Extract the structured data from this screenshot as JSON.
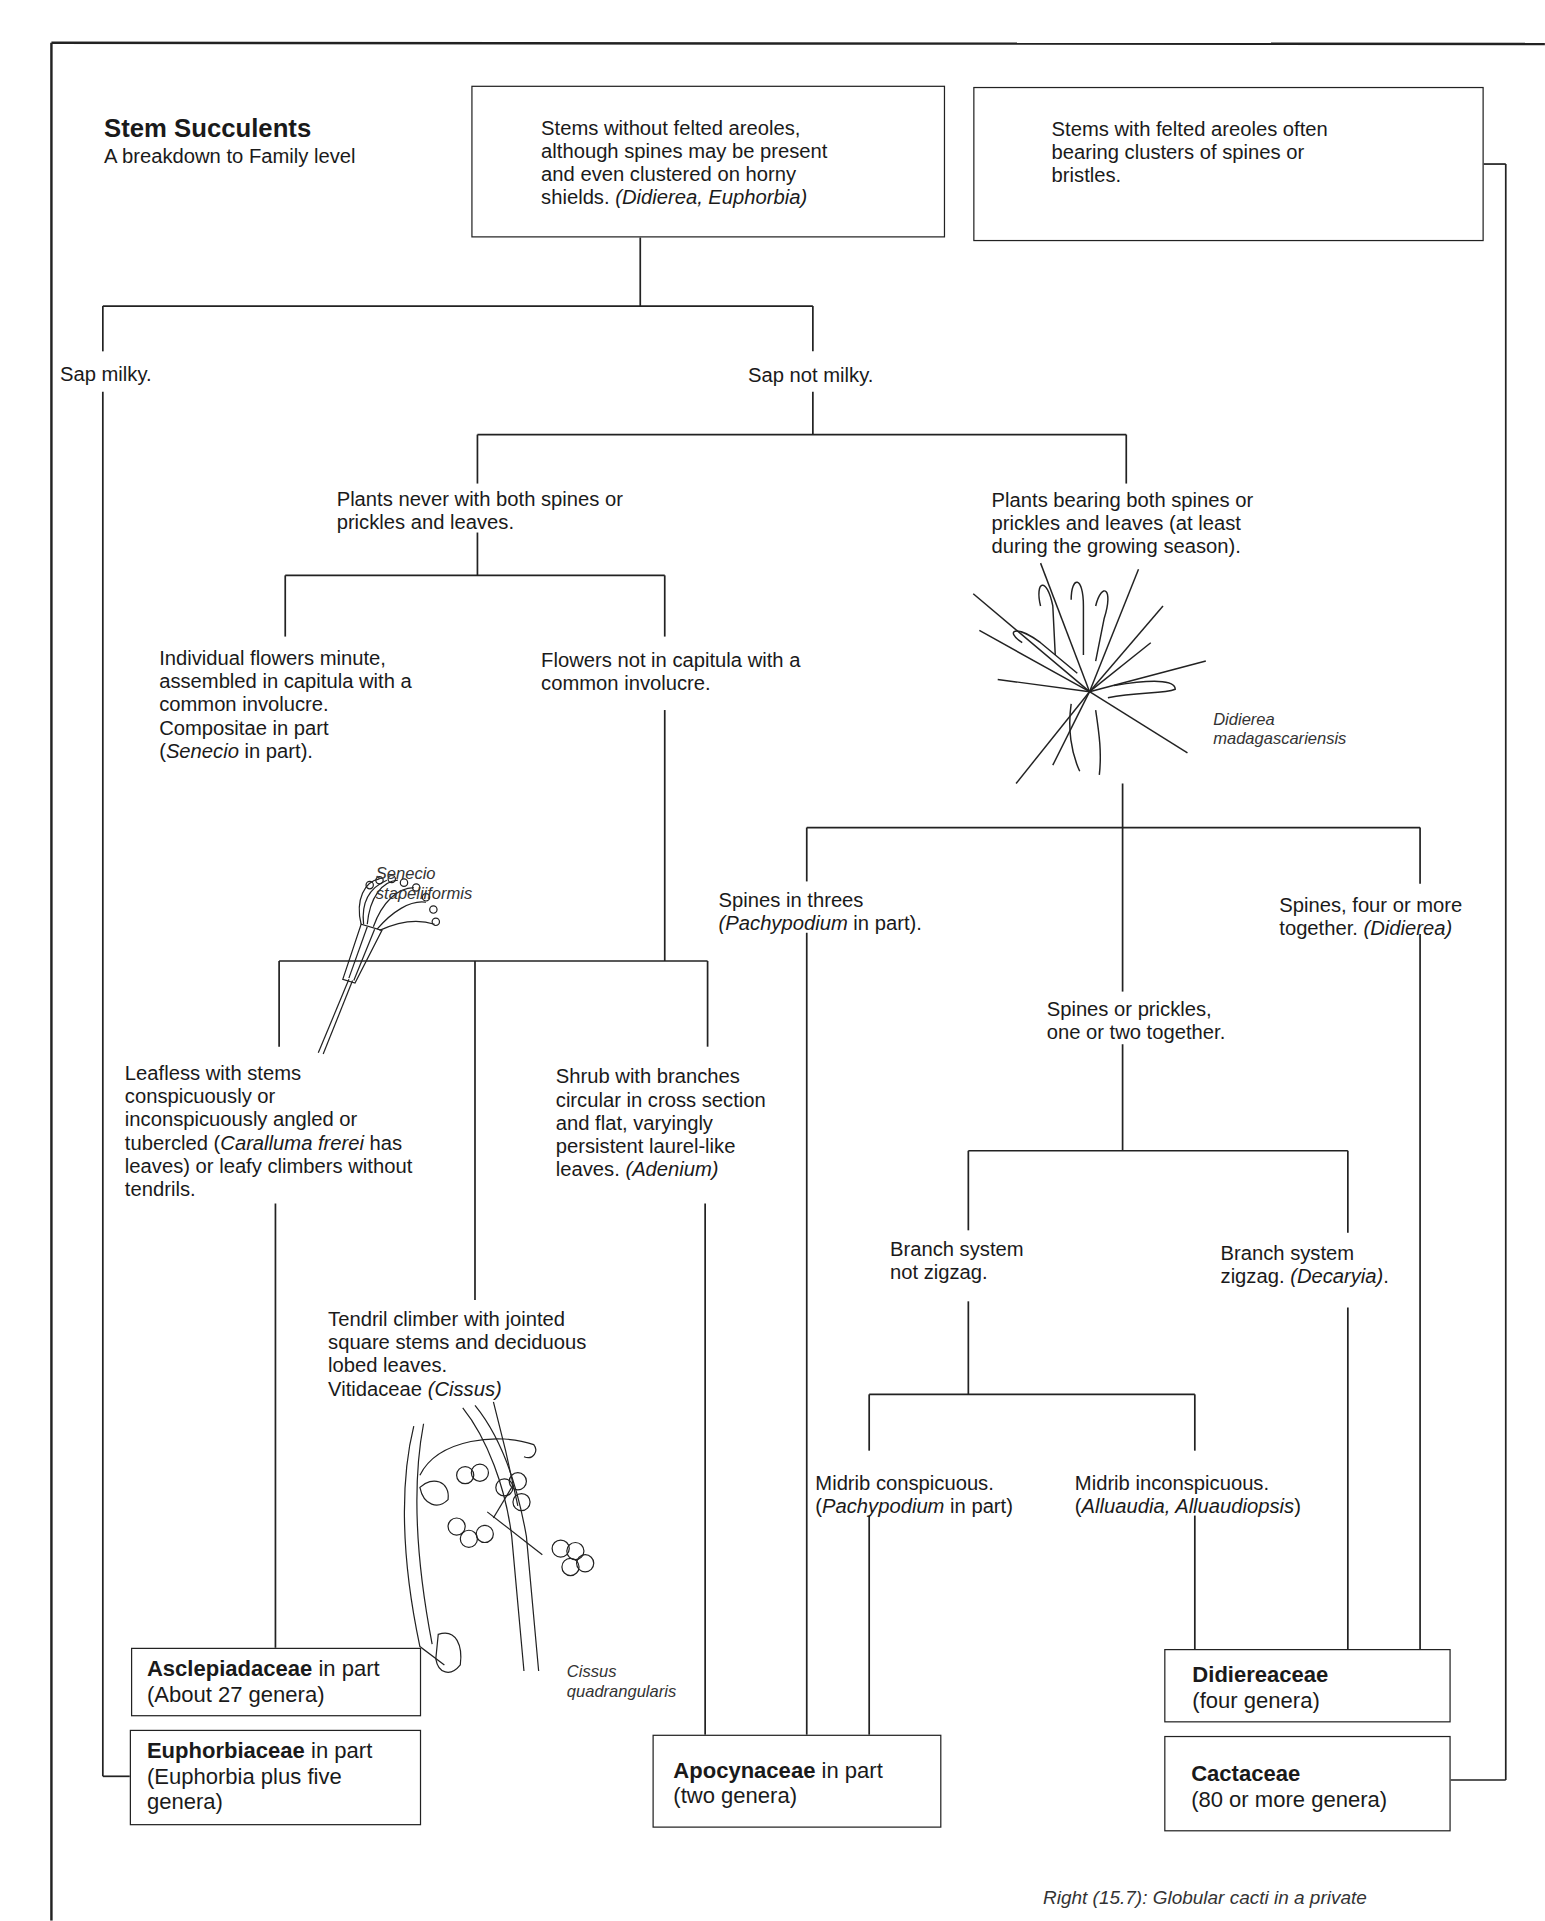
{
  "header": {
    "title": "Stem Succulents",
    "subtitle": "A breakdown to Family level"
  },
  "top_boxes": {
    "without_areoles": {
      "lines": [
        "Stems without felted areoles,",
        "although spines may be present",
        "and even clustered on horny"
      ],
      "last_line_plain": "shields. ",
      "last_line_italic": "(Didierea, Euphorbia)"
    },
    "with_areoles": {
      "lines": [
        "Stems with felted areoles often",
        "bearing clusters of spines or",
        "bristles."
      ]
    }
  },
  "nodes": {
    "sap_milky": "Sap milky.",
    "sap_not_milky": "Sap not milky.",
    "never_both": [
      "Plants never with both spines or",
      "prickles and leaves."
    ],
    "bearing_both": [
      "Plants bearing both spines or",
      "prickles and leaves (at least",
      "during the growing season)."
    ],
    "capitula": {
      "lines": [
        "Individual flowers minute,",
        "assembled in capitula with a",
        "common involucre.",
        "Compositae in part"
      ],
      "last_italic": "Senecio",
      "last_plain_pre": "(",
      "last_plain_post": " in part)."
    },
    "not_capitula": [
      "Flowers not in capitula with a",
      "common involucre."
    ],
    "spines_threes": {
      "line1": "Spines in threes",
      "italic": "(Pachypodium",
      "plain": " in part)."
    },
    "spines_four": {
      "line1": "Spines, four or more",
      "plain": "together. ",
      "italic": "(Didierea)"
    },
    "spines_one_two": [
      "Spines or prickles,",
      "one or two together."
    ],
    "leafless": {
      "line1": "Leafless with stems",
      "line2": "conspicuously or",
      "line3": "inconspicuously angled or",
      "line4_pre": "tubercled (",
      "line4_italic": "Caralluma frerei",
      "line4_post": " has",
      "line5": "leaves) or leafy climbers without",
      "line6": "tendrils."
    },
    "shrub": {
      "lines": [
        "Shrub with branches",
        "circular in cross section",
        "and flat, varyingly",
        "persistent laurel-like"
      ],
      "last_plain": "leaves. ",
      "last_italic": "(Adenium)"
    },
    "tendril": {
      "lines": [
        "Tendril climber with jointed",
        "square stems and deciduous",
        "lobed leaves."
      ],
      "last_plain": "Vitidaceae ",
      "last_italic": "(Cissus)"
    },
    "not_zigzag": [
      "Branch system",
      "not zigzag."
    ],
    "zigzag": {
      "line1": "Branch system",
      "plain": "zigzag. ",
      "italic": "(Decaryia)",
      "post": "."
    },
    "midrib_conspicuous": {
      "line1": "Midrib conspicuous.",
      "pre": "(",
      "italic": "Pachypodium",
      "post": " in part)"
    },
    "midrib_inconspicuous": {
      "line1": "Midrib inconspicuous.",
      "pre": "(",
      "italic": "Alluaudia, Alluaudiopsis",
      "post": ")"
    }
  },
  "families": {
    "asclepiadaceae": {
      "name": "Asclepiadaceae",
      "suffix": " in part",
      "line2": "(About 27 genera)"
    },
    "euphorbiaceae": {
      "name": "Euphorbiaceae",
      "suffix": " in part",
      "line2_pre": "(",
      "line2_italic": "Euphorbia",
      "line2_post": " plus five",
      "line3": "genera)"
    },
    "apocynaceae": {
      "name": "Apocynaceae",
      "suffix": " in part",
      "line2": "(two genera)"
    },
    "didiereaceae": {
      "name": "Didiereaceae",
      "line2": "(four genera)"
    },
    "cactaceae": {
      "name": "Cactaceae",
      "line2": "(80 or more genera)"
    }
  },
  "illustrations": {
    "senecio": {
      "caption": [
        "Senecio",
        "stapeliiformis"
      ],
      "icon": "senecio-flower-illustration"
    },
    "didierea": {
      "caption": [
        "Didierea",
        "madagascariensis"
      ],
      "icon": "didierea-spiny-plant-illustration"
    },
    "cissus": {
      "caption": [
        "Cissus",
        "quadrangularis"
      ],
      "icon": "cissus-vine-illustration"
    }
  },
  "footer": {
    "caption": "Right (15.7): Globular cacti in a private"
  },
  "colors": {
    "ink": "#1a1a1a",
    "paper": "#ffffff"
  }
}
